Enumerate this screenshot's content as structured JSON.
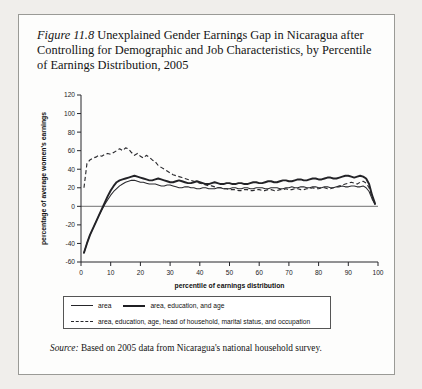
{
  "figure": {
    "number_label": "Figure 11.8",
    "title": " Unexplained Gender Earnings Gap in Nicaragua after Controlling for Demographic and Job Characteristics, by Percentile of Earnings Distribution, 2005",
    "source_label": "Source:",
    "source_text": " Based on 2005 data from Nicaragua's national household survey."
  },
  "legend": {
    "entries": [
      {
        "label": "area",
        "style": "thin-solid"
      },
      {
        "label": "area, education, and age",
        "style": "thick-solid"
      },
      {
        "label": "area, education, age, head of household, marital status, and occupation",
        "style": "dashed"
      }
    ]
  },
  "chart_data": {
    "type": "line",
    "title": "Unexplained Gender Earnings Gap in Nicaragua",
    "xlabel": "percentile of earnings distribution",
    "ylabel": "percentage of average women's earnings",
    "xlim": [
      0,
      100
    ],
    "ylim": [
      -60,
      120
    ],
    "xticks": [
      0,
      10,
      20,
      30,
      40,
      50,
      60,
      70,
      80,
      90,
      100
    ],
    "yticks": [
      -60,
      -40,
      -20,
      0,
      20,
      40,
      60,
      80,
      100,
      120
    ],
    "grid": false,
    "zero_reference_line": 0,
    "legend_position": "below-plot",
    "x": [
      1,
      2,
      3,
      4,
      5,
      6,
      7,
      8,
      9,
      10,
      11,
      12,
      13,
      14,
      15,
      16,
      17,
      18,
      19,
      20,
      21,
      22,
      23,
      24,
      25,
      26,
      27,
      28,
      29,
      30,
      31,
      32,
      33,
      34,
      35,
      36,
      37,
      38,
      39,
      40,
      41,
      42,
      43,
      44,
      45,
      46,
      47,
      48,
      49,
      50,
      51,
      52,
      53,
      54,
      55,
      56,
      57,
      58,
      59,
      60,
      61,
      62,
      63,
      64,
      65,
      66,
      67,
      68,
      69,
      70,
      71,
      72,
      73,
      74,
      75,
      76,
      77,
      78,
      79,
      80,
      81,
      82,
      83,
      84,
      85,
      86,
      87,
      88,
      89,
      90,
      91,
      92,
      93,
      94,
      95,
      96,
      97,
      98,
      99
    ],
    "series": [
      {
        "name": "area",
        "style": "thin-solid",
        "values": [
          -50,
          -40,
          -31,
          -24,
          -17,
          -10,
          -4,
          2,
          7,
          12,
          16,
          19,
          22,
          24,
          26,
          27,
          28,
          28,
          27,
          26,
          26,
          25,
          24,
          24,
          24,
          23,
          22,
          22,
          23,
          23,
          22,
          21,
          20,
          20,
          21,
          21,
          20,
          20,
          19,
          19,
          20,
          20,
          19,
          19,
          19,
          20,
          20,
          19,
          19,
          19,
          20,
          20,
          19,
          19,
          20,
          20,
          19,
          19,
          20,
          20,
          20,
          19,
          19,
          20,
          20,
          20,
          19,
          19,
          20,
          20,
          21,
          20,
          20,
          21,
          21,
          20,
          20,
          21,
          21,
          20,
          20,
          21,
          21,
          20,
          20,
          21,
          21,
          22,
          21,
          21,
          22,
          22,
          21,
          21,
          22,
          20,
          16,
          8,
          2
        ]
      },
      {
        "name": "area, education, and age",
        "style": "thick-solid",
        "values": [
          -50,
          -40,
          -31,
          -24,
          -17,
          -10,
          -3,
          4,
          11,
          17,
          22,
          26,
          28,
          29,
          30,
          31,
          32,
          33,
          32,
          31,
          30,
          29,
          28,
          28,
          29,
          30,
          29,
          28,
          27,
          26,
          26,
          27,
          28,
          27,
          26,
          25,
          25,
          26,
          27,
          26,
          25,
          24,
          24,
          25,
          26,
          25,
          24,
          24,
          25,
          25,
          24,
          24,
          25,
          25,
          24,
          24,
          25,
          26,
          26,
          25,
          25,
          26,
          27,
          27,
          26,
          26,
          27,
          28,
          28,
          27,
          27,
          28,
          29,
          29,
          28,
          28,
          29,
          30,
          30,
          29,
          29,
          30,
          31,
          31,
          30,
          30,
          31,
          32,
          33,
          33,
          32,
          31,
          32,
          33,
          32,
          30,
          24,
          12,
          3
        ]
      },
      {
        "name": "area, education, age, head of household, marital status, and occupation",
        "style": "dashed",
        "values": [
          20,
          46,
          50,
          52,
          53,
          55,
          54,
          56,
          57,
          56,
          58,
          60,
          62,
          60,
          63,
          62,
          58,
          55,
          57,
          54,
          52,
          55,
          53,
          50,
          48,
          44,
          42,
          40,
          38,
          36,
          34,
          33,
          32,
          31,
          30,
          29,
          28,
          27,
          26,
          25,
          24,
          23,
          22,
          22,
          21,
          20,
          20,
          19,
          19,
          18,
          18,
          18,
          17,
          17,
          18,
          18,
          17,
          17,
          18,
          18,
          17,
          17,
          18,
          18,
          17,
          17,
          18,
          18,
          19,
          18,
          18,
          19,
          19,
          18,
          18,
          19,
          19,
          20,
          19,
          19,
          20,
          20,
          19,
          19,
          20,
          21,
          22,
          23,
          24,
          25,
          26,
          25,
          24,
          26,
          27,
          25,
          20,
          10,
          2
        ]
      }
    ]
  }
}
